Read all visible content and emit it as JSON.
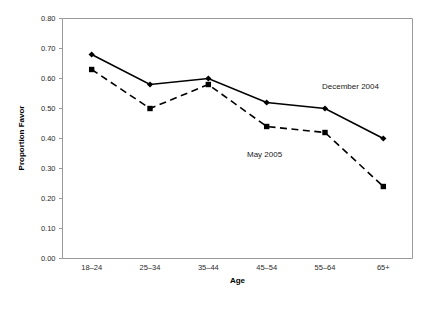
{
  "chart_data": {
    "type": "line",
    "title": "",
    "xlabel": "Age",
    "ylabel": "Proportion Favor",
    "categories": [
      "18–24",
      "25–34",
      "35–44",
      "45–54",
      "55–64",
      "65+"
    ],
    "ylim": [
      0.0,
      0.8
    ],
    "yticks": [
      "0.00",
      "0.10",
      "0.20",
      "0.30",
      "0.40",
      "0.50",
      "0.60",
      "0.70",
      "0.80"
    ],
    "ytick_values": [
      0.0,
      0.1,
      0.2,
      0.3,
      0.4,
      0.5,
      0.6,
      0.7,
      0.8
    ],
    "grid": false,
    "legend": "inline-annotations",
    "series": [
      {
        "name": "December 2004",
        "values": [
          0.68,
          0.58,
          0.6,
          0.52,
          0.5,
          0.4
        ],
        "style": "solid",
        "marker": "diamond",
        "color": "#000000",
        "label_x": 322,
        "label_y": 89
      },
      {
        "name": "May 2005",
        "values": [
          0.63,
          0.5,
          0.58,
          0.44,
          0.42,
          0.24
        ],
        "style": "dashed",
        "marker": "square",
        "color": "#000000",
        "label_x": 247,
        "label_y": 157
      }
    ]
  },
  "axes": {
    "y_title": "Proportion Favor",
    "x_title": "Age"
  }
}
